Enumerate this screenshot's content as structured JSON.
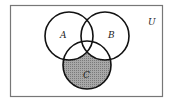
{
  "diagram": {
    "type": "venn",
    "universe_label": "U",
    "sets": [
      {
        "label": "A",
        "cx": 69,
        "cy": 36,
        "r": 24
      },
      {
        "label": "B",
        "cx": 105,
        "cy": 36,
        "r": 24
      },
      {
        "label": "C",
        "cx": 87,
        "cy": 65,
        "r": 24
      }
    ],
    "shaded_region": "C only (C − (A ∪ B))",
    "colors": {
      "stroke": "#111111",
      "shade": "#9a9a9a",
      "border": "#777777",
      "background": "#ffffff"
    }
  }
}
